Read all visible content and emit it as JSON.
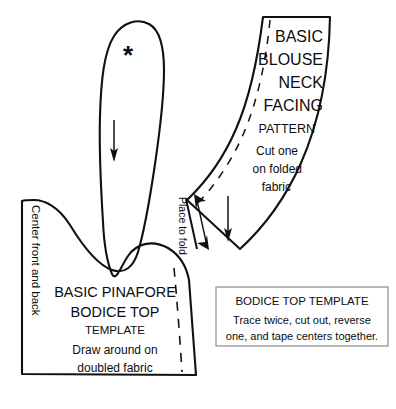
{
  "document": {
    "kind": "sewing-pattern-diagram",
    "background_color": "#ffffff",
    "ink_color": "#111111",
    "width": 396,
    "height": 409
  },
  "bodice_piece": {
    "marker": "*",
    "grain_arrow": "down-arrow",
    "edge_label": "Center front and back",
    "title_line_1": "BASIC PINAFORE",
    "title_line_2": "BODICE TOP",
    "title_line_3": "TEMPLATE",
    "instruction_line_1": "Draw around on",
    "instruction_line_2": "doubled fabric"
  },
  "facing_piece": {
    "title_line_1": "BASIC",
    "title_line_2": "BLOUSE",
    "title_line_3": "NECK",
    "title_line_4": "FACING",
    "subtitle": "PATTERN",
    "instruction_line_1": "Cut one",
    "instruction_line_2": "on folded",
    "instruction_line_3": "fabric",
    "fold_label": "Place to fold",
    "grain_arrow": "down-arrow",
    "fold_arrow": "double-headed-arrow"
  },
  "note_box": {
    "heading": "BODICE TOP TEMPLATE",
    "body_line_1": "Trace twice, cut out, reverse",
    "body_line_2": "one, and tape centers together.",
    "border_color": "#8c8c8c"
  }
}
